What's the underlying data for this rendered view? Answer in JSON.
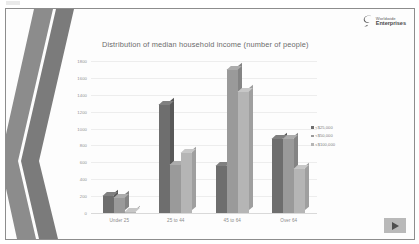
{
  "slide": {
    "logo": {
      "line1": "Worldwide",
      "line2": "Enterprises",
      "icon": "swoosh-mark"
    },
    "play_button_icon": "play-triangle-icon"
  },
  "chart_data": {
    "type": "bar",
    "title": "Distribution of median household income (number of people)",
    "xlabel": "",
    "ylabel": "",
    "ylim": [
      0,
      1800
    ],
    "yticks": [
      1800,
      1600,
      1400,
      1200,
      1000,
      800,
      600,
      400,
      200,
      0
    ],
    "grid": true,
    "legend_position": "right",
    "categories": [
      "Under 25",
      "25 to 44",
      "45 to 64",
      "Over 64"
    ],
    "series": [
      {
        "name": "<$25,000",
        "values": [
          205,
          1290,
          560,
          880
        ],
        "color": "#6e6e6e"
      },
      {
        "name": "<$50,000",
        "values": [
          185,
          575,
          1700,
          880
        ],
        "color": "#9a9a9a"
      },
      {
        "name": "<$100,000",
        "values": [
          15,
          715,
          1440,
          525
        ],
        "color": "#b5b5b5"
      }
    ]
  }
}
